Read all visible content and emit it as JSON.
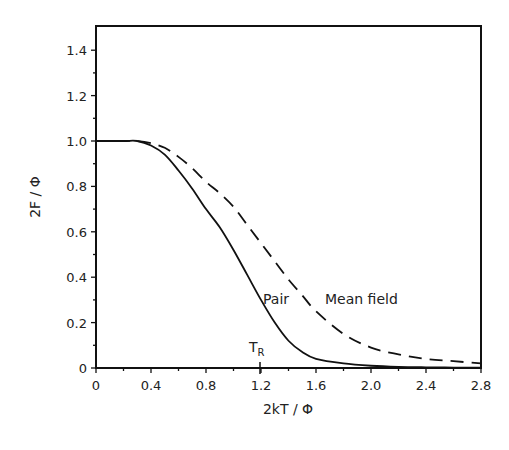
{
  "chart_data": {
    "type": "line",
    "title": "",
    "xlabel": "2kT / Φ",
    "ylabel": "2F / Φ",
    "xlim": [
      0,
      2.8
    ],
    "ylim": [
      0,
      1.5
    ],
    "xticks": [
      "0",
      "0.4",
      "0.8",
      "1.2",
      "1.6",
      "2.0",
      "2.4",
      "2.8"
    ],
    "yticks": [
      "0",
      "0.2",
      "0.4",
      "0.6",
      "0.8",
      "1.0",
      "1.2",
      "1.4"
    ],
    "grid": false,
    "legend": "none (inline labels)",
    "series": [
      {
        "name": "Pair",
        "style": "solid",
        "x": [
          0,
          0.2,
          0.3,
          0.4,
          0.5,
          0.6,
          0.7,
          0.8,
          0.9,
          1.0,
          1.1,
          1.2,
          1.3,
          1.4,
          1.5,
          1.6,
          1.8,
          2.0,
          2.2,
          2.4,
          2.6,
          2.8
        ],
        "values": [
          1.0,
          1.0,
          1.0,
          0.98,
          0.94,
          0.87,
          0.79,
          0.7,
          0.62,
          0.52,
          0.41,
          0.3,
          0.2,
          0.12,
          0.07,
          0.04,
          0.02,
          0.01,
          0.005,
          0.003,
          0.002,
          0.001
        ]
      },
      {
        "name": "Mean field",
        "style": "dashed",
        "x": [
          0,
          0.2,
          0.3,
          0.4,
          0.5,
          0.6,
          0.7,
          0.8,
          0.9,
          1.0,
          1.1,
          1.2,
          1.3,
          1.4,
          1.5,
          1.6,
          1.8,
          2.0,
          2.2,
          2.4,
          2.6,
          2.8
        ],
        "values": [
          1.0,
          1.0,
          1.0,
          0.99,
          0.97,
          0.93,
          0.88,
          0.82,
          0.77,
          0.71,
          0.63,
          0.55,
          0.47,
          0.39,
          0.32,
          0.25,
          0.15,
          0.09,
          0.06,
          0.04,
          0.03,
          0.02
        ]
      }
    ],
    "annotations": [
      {
        "text": "Pair",
        "x": 1.3,
        "y": 0.31
      },
      {
        "text": "Mean field",
        "x": 1.68,
        "y": 0.31
      },
      {
        "text": "T",
        "sub": "R",
        "x": 1.15,
        "y": 0.08
      },
      {
        "text": "T_R tick mark",
        "x": 1.2
      }
    ]
  }
}
